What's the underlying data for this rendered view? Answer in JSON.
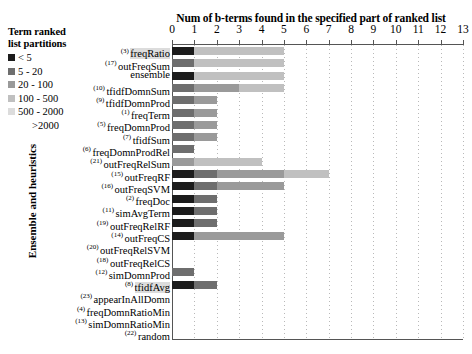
{
  "chart_data": {
    "type": "bar",
    "orientation": "horizontal",
    "stacked": true,
    "title": "Num of b-terms found in the specified part of ranked list",
    "xlabel": "",
    "ylabel": "Ensemble and heuristics",
    "xlim": [
      0,
      13
    ],
    "xticks": [
      0,
      1,
      2,
      3,
      4,
      5,
      6,
      7,
      8,
      9,
      10,
      11,
      12,
      13
    ],
    "grid": true,
    "legend_title": "Term ranked list partitions",
    "legend_position": "top-left",
    "series": [
      {
        "name": "< 5",
        "color": "#1c1c1c"
      },
      {
        "name": "5 - 20",
        "color": "#6e6e6e"
      },
      {
        "name": "20 - 100",
        "color": "#9a9a9a"
      },
      {
        "name": "100 - 500",
        "color": "#c0c0c0"
      },
      {
        "name": "500 - 2000",
        "color": "#dcdcdc"
      },
      {
        "name": ">2000",
        "color": "#f0f0f0"
      }
    ],
    "categories": [
      {
        "index": "(3)",
        "label": "freqRatio",
        "values": [
          1,
          0,
          0,
          4,
          0,
          0
        ],
        "highlight": true
      },
      {
        "index": "(17)",
        "label": "outFreqSum",
        "values": [
          0,
          1,
          0,
          4,
          0,
          0
        ],
        "highlight": false
      },
      {
        "index": "",
        "label": "ensemble",
        "values": [
          1,
          0,
          0,
          4,
          0,
          0
        ],
        "highlight": false
      },
      {
        "index": "(10)",
        "label": "tfidfDomnSum",
        "values": [
          0,
          1,
          2,
          2,
          0,
          0
        ],
        "highlight": false
      },
      {
        "index": "(9)",
        "label": "tfidfDomnProd",
        "values": [
          0,
          1,
          1,
          0,
          0,
          0
        ],
        "highlight": false
      },
      {
        "index": "(1)",
        "label": "freqTerm",
        "values": [
          0,
          1,
          1,
          0,
          0,
          0
        ],
        "highlight": false
      },
      {
        "index": "(5)",
        "label": "freqDomnProd",
        "values": [
          0,
          1,
          1,
          0,
          0,
          0
        ],
        "highlight": false
      },
      {
        "index": "(7)",
        "label": "tfidfSum",
        "values": [
          0,
          1,
          1,
          0,
          0,
          0
        ],
        "highlight": false
      },
      {
        "index": "(6)",
        "label": "freqDomnProdRel",
        "values": [
          0,
          1,
          0,
          0,
          0,
          0
        ],
        "highlight": false
      },
      {
        "index": "(21)",
        "label": "outFreqRelSum",
        "values": [
          0,
          0,
          1,
          3,
          0,
          0
        ],
        "highlight": false
      },
      {
        "index": "(15)",
        "label": "outFreqRF",
        "values": [
          1,
          1,
          3,
          2,
          0,
          0
        ],
        "highlight": false
      },
      {
        "index": "(16)",
        "label": "outFreqSVM",
        "values": [
          1,
          1,
          3,
          0,
          0,
          0
        ],
        "highlight": false
      },
      {
        "index": "(2)",
        "label": "freqDoc",
        "values": [
          1,
          1,
          0,
          0,
          0,
          0
        ],
        "highlight": false
      },
      {
        "index": "(11)",
        "label": "simAvgTerm",
        "values": [
          1,
          1,
          0,
          0,
          0,
          0
        ],
        "highlight": false
      },
      {
        "index": "(19)",
        "label": "outFreqRelRF",
        "values": [
          1,
          1,
          0,
          0,
          0,
          0
        ],
        "highlight": false
      },
      {
        "index": "(14)",
        "label": "outFreqCS",
        "values": [
          1,
          0,
          4,
          0,
          0,
          0
        ],
        "highlight": false
      },
      {
        "index": "(20)",
        "label": "outFreqRelSVM",
        "values": [
          0,
          0,
          0,
          0,
          0,
          0
        ],
        "highlight": false
      },
      {
        "index": "(18)",
        "label": "outFreqRelCS",
        "values": [
          0,
          0,
          0,
          0,
          0,
          0
        ],
        "highlight": false
      },
      {
        "index": "(12)",
        "label": "simDomnProd",
        "values": [
          0,
          1,
          0,
          0,
          0,
          0
        ],
        "highlight": false
      },
      {
        "index": "(8)",
        "label": "tfidfAvg",
        "values": [
          1,
          1,
          0,
          0,
          0,
          0
        ],
        "highlight": true
      },
      {
        "index": "(23)",
        "label": "appearInAllDomn",
        "values": [
          0,
          0,
          0,
          0,
          0,
          0
        ],
        "highlight": false
      },
      {
        "index": "(4)",
        "label": "freqDomnRatioMin",
        "values": [
          0,
          0,
          0,
          0,
          0,
          0
        ],
        "highlight": false
      },
      {
        "index": "(13)",
        "label": "simDomnRatioMin",
        "values": [
          0,
          0,
          0,
          0,
          0,
          0
        ],
        "highlight": false
      },
      {
        "index": "(22)",
        "label": "random",
        "values": [
          0,
          0,
          0,
          0,
          0,
          0
        ],
        "highlight": false
      }
    ]
  }
}
